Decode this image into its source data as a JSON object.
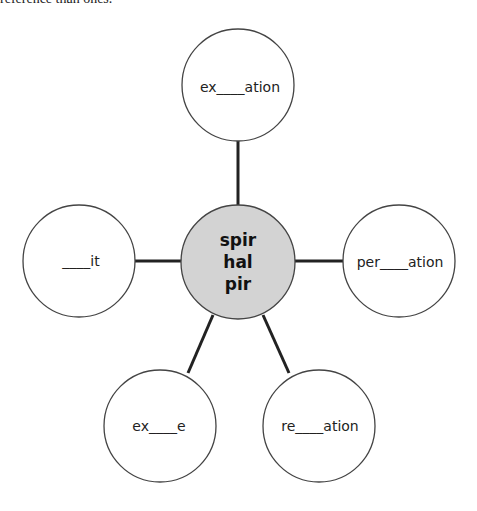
{
  "top_text": "reference than ones.",
  "hub": {
    "lines": [
      "spir",
      "hal",
      "pir"
    ],
    "fill": "#d3d3d3"
  },
  "spokes": [
    {
      "id": "top",
      "label": "ex____ation"
    },
    {
      "id": "left",
      "label": "____it"
    },
    {
      "id": "right",
      "label": "per____ation"
    },
    {
      "id": "bottom-left",
      "label": "ex____e"
    },
    {
      "id": "bottom-right",
      "label": "re____ation"
    }
  ]
}
